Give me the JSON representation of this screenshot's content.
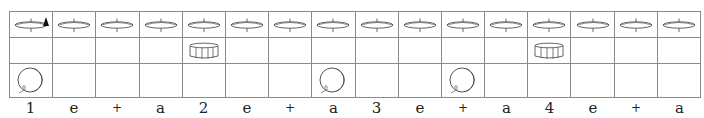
{
  "grid": {
    "rows": [
      {
        "instrument": "hi-hat",
        "icon": "hihat-icon"
      },
      {
        "instrument": "snare",
        "icon": "snare-icon"
      },
      {
        "instrument": "bass-drum",
        "icon": "bass-drum-icon"
      }
    ],
    "counts": [
      "1",
      "e",
      "+",
      "a",
      "2",
      "e",
      "+",
      "a",
      "3",
      "e",
      "+",
      "a",
      "4",
      "e",
      "+",
      "a"
    ],
    "hihat_hits": [
      1,
      1,
      1,
      1,
      1,
      1,
      1,
      1,
      1,
      1,
      1,
      1,
      1,
      1,
      1,
      1
    ],
    "hihat_accents": [
      1,
      0,
      0,
      0,
      0,
      0,
      0,
      0,
      0,
      0,
      0,
      0,
      0,
      0,
      0,
      0
    ],
    "snare_hits": [
      0,
      0,
      0,
      0,
      1,
      0,
      0,
      0,
      0,
      0,
      0,
      0,
      1,
      0,
      0,
      0
    ],
    "bass_hits": [
      1,
      0,
      0,
      0,
      0,
      0,
      0,
      1,
      0,
      0,
      1,
      0,
      0,
      0,
      0,
      0
    ]
  },
  "colors": {
    "grid_line": "#8a8a8a",
    "icon_stroke": "#555555",
    "accent": "#111111"
  }
}
